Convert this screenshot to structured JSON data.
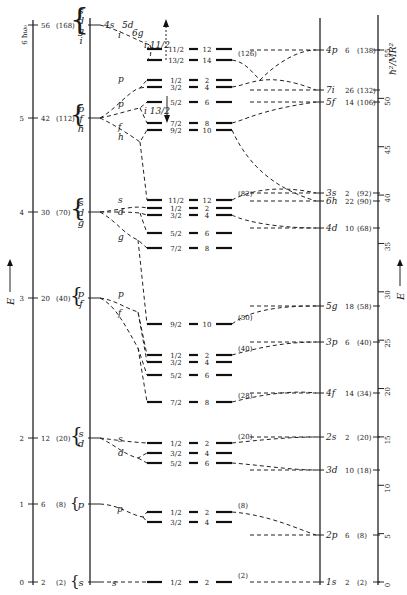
{
  "chart_data": {
    "type": "level-diagram",
    "title": "",
    "left_axis": {
      "label": "E",
      "arrow": "up",
      "shells": [
        {
          "n": 0,
          "label": "0",
          "degeneracy": "2",
          "cumulative": "(2)",
          "orbitals": [
            "s"
          ]
        },
        {
          "n": 1,
          "label": "1",
          "degeneracy": "6",
          "cumulative": "(8)",
          "orbitals": [
            "p"
          ]
        },
        {
          "n": 2,
          "label": "2",
          "degeneracy": "12",
          "cumulative": "(20)",
          "orbitals": [
            "s",
            "d"
          ]
        },
        {
          "n": 3,
          "label": "3",
          "degeneracy": "20",
          "cumulative": "(40)",
          "orbitals": [
            "p",
            "f"
          ]
        },
        {
          "n": 4,
          "label": "4",
          "degeneracy": "30",
          "cumulative": "(70)",
          "orbitals": [
            "s",
            "d",
            "g"
          ]
        },
        {
          "n": 5,
          "label": "5",
          "degeneracy": "42",
          "cumulative": "(112)",
          "orbitals": [
            "p",
            "f",
            "h"
          ]
        },
        {
          "n": 6,
          "label": "6 ħω₀",
          "degeneracy": "56",
          "cumulative": "(168)",
          "orbitals": [
            "s",
            "d",
            "g",
            "i"
          ]
        }
      ]
    },
    "top_labels": [
      "4s",
      "5d",
      "6g",
      "i 11/2"
    ],
    "middle_levels": [
      {
        "j": "1/2",
        "deg": "2",
        "shell": 0,
        "magic": "(2)"
      },
      {
        "j": "1/2",
        "deg": "2",
        "shell": 1,
        "magic": "(8)"
      },
      {
        "j": "3/2",
        "deg": "4",
        "shell": 1
      },
      {
        "j": "1/2",
        "deg": "2",
        "shell": 2,
        "magic": "(20)"
      },
      {
        "j": "3/2",
        "deg": "4",
        "shell": 2
      },
      {
        "j": "5/2",
        "deg": "6",
        "shell": 2
      },
      {
        "j": "7/2",
        "deg": "8",
        "shell": 3,
        "magic": "(28)"
      },
      {
        "j": "5/2",
        "deg": "6",
        "shell": 3
      },
      {
        "j": "3/2",
        "deg": "4",
        "shell": 3
      },
      {
        "j": "1/2",
        "deg": "2",
        "shell": 3,
        "magic": "(40)"
      },
      {
        "j": "9/2",
        "deg": "10",
        "shell": 4,
        "magic": "(50)"
      },
      {
        "j": "7/2",
        "deg": "8",
        "shell": 4
      },
      {
        "j": "5/2",
        "deg": "6",
        "shell": 4
      },
      {
        "j": "3/2",
        "deg": "4",
        "shell": 4
      },
      {
        "j": "1/2",
        "deg": "2",
        "shell": 4
      },
      {
        "j": "11/2",
        "deg": "12",
        "shell": 5,
        "magic": "(82)"
      },
      {
        "j": "9/2",
        "deg": "10",
        "shell": 5
      },
      {
        "j": "7/2",
        "deg": "8",
        "shell": 5
      },
      {
        "j": "5/2",
        "deg": "6",
        "shell": 5
      },
      {
        "j": "3/2",
        "deg": "4",
        "shell": 5
      },
      {
        "j": "1/2",
        "deg": "2",
        "shell": 5
      },
      {
        "j": "13/2",
        "deg": "14",
        "shell": 6,
        "magic": "(126)"
      },
      {
        "j": "11/2",
        "deg": "12",
        "shell": 6
      }
    ],
    "branch_labels": [
      "s",
      "p",
      "s",
      "d",
      "p",
      "f",
      "s",
      "d",
      "g",
      "p",
      "f",
      "h",
      "i",
      "p",
      "i 13/2"
    ],
    "right_levels": [
      {
        "label": "1s",
        "deg": "2",
        "cumulative": "(2)",
        "energy": 0
      },
      {
        "label": "2p",
        "deg": "6",
        "cumulative": "(8)",
        "energy": 5
      },
      {
        "label": "3d",
        "deg": "10",
        "cumulative": "(18)",
        "energy": 11.5
      },
      {
        "label": "2s",
        "deg": "2",
        "cumulative": "(20)",
        "energy": 15
      },
      {
        "label": "4f",
        "deg": "14",
        "cumulative": "(34)",
        "energy": 19.5
      },
      {
        "label": "3p",
        "deg": "6",
        "cumulative": "(40)",
        "energy": 24.5
      },
      {
        "label": "5g",
        "deg": "18",
        "cumulative": "(58)",
        "energy": 28.5
      },
      {
        "label": "4d",
        "deg": "10",
        "cumulative": "(68)",
        "energy": 36
      },
      {
        "label": "6h",
        "deg": "22",
        "cumulative": "(90)",
        "energy": 38.8
      },
      {
        "label": "3s",
        "deg": "2",
        "cumulative": "(92)",
        "energy": 39.5
      },
      {
        "label": "5f",
        "deg": "14",
        "cumulative": "(106)",
        "energy": 49
      },
      {
        "label": "7i",
        "deg": "26",
        "cumulative": "(132)",
        "energy": 50.3
      },
      {
        "label": "4p",
        "deg": "6",
        "cumulative": "(138)",
        "energy": 55.5
      }
    ],
    "right_axis": {
      "label": "ħ²/MR²",
      "ticks": [
        "0",
        "5",
        "10",
        "15",
        "20",
        "25",
        "30",
        "35",
        "40",
        "45",
        "50",
        "55"
      ],
      "range": [
        0,
        55
      ],
      "side_label": "E"
    }
  }
}
